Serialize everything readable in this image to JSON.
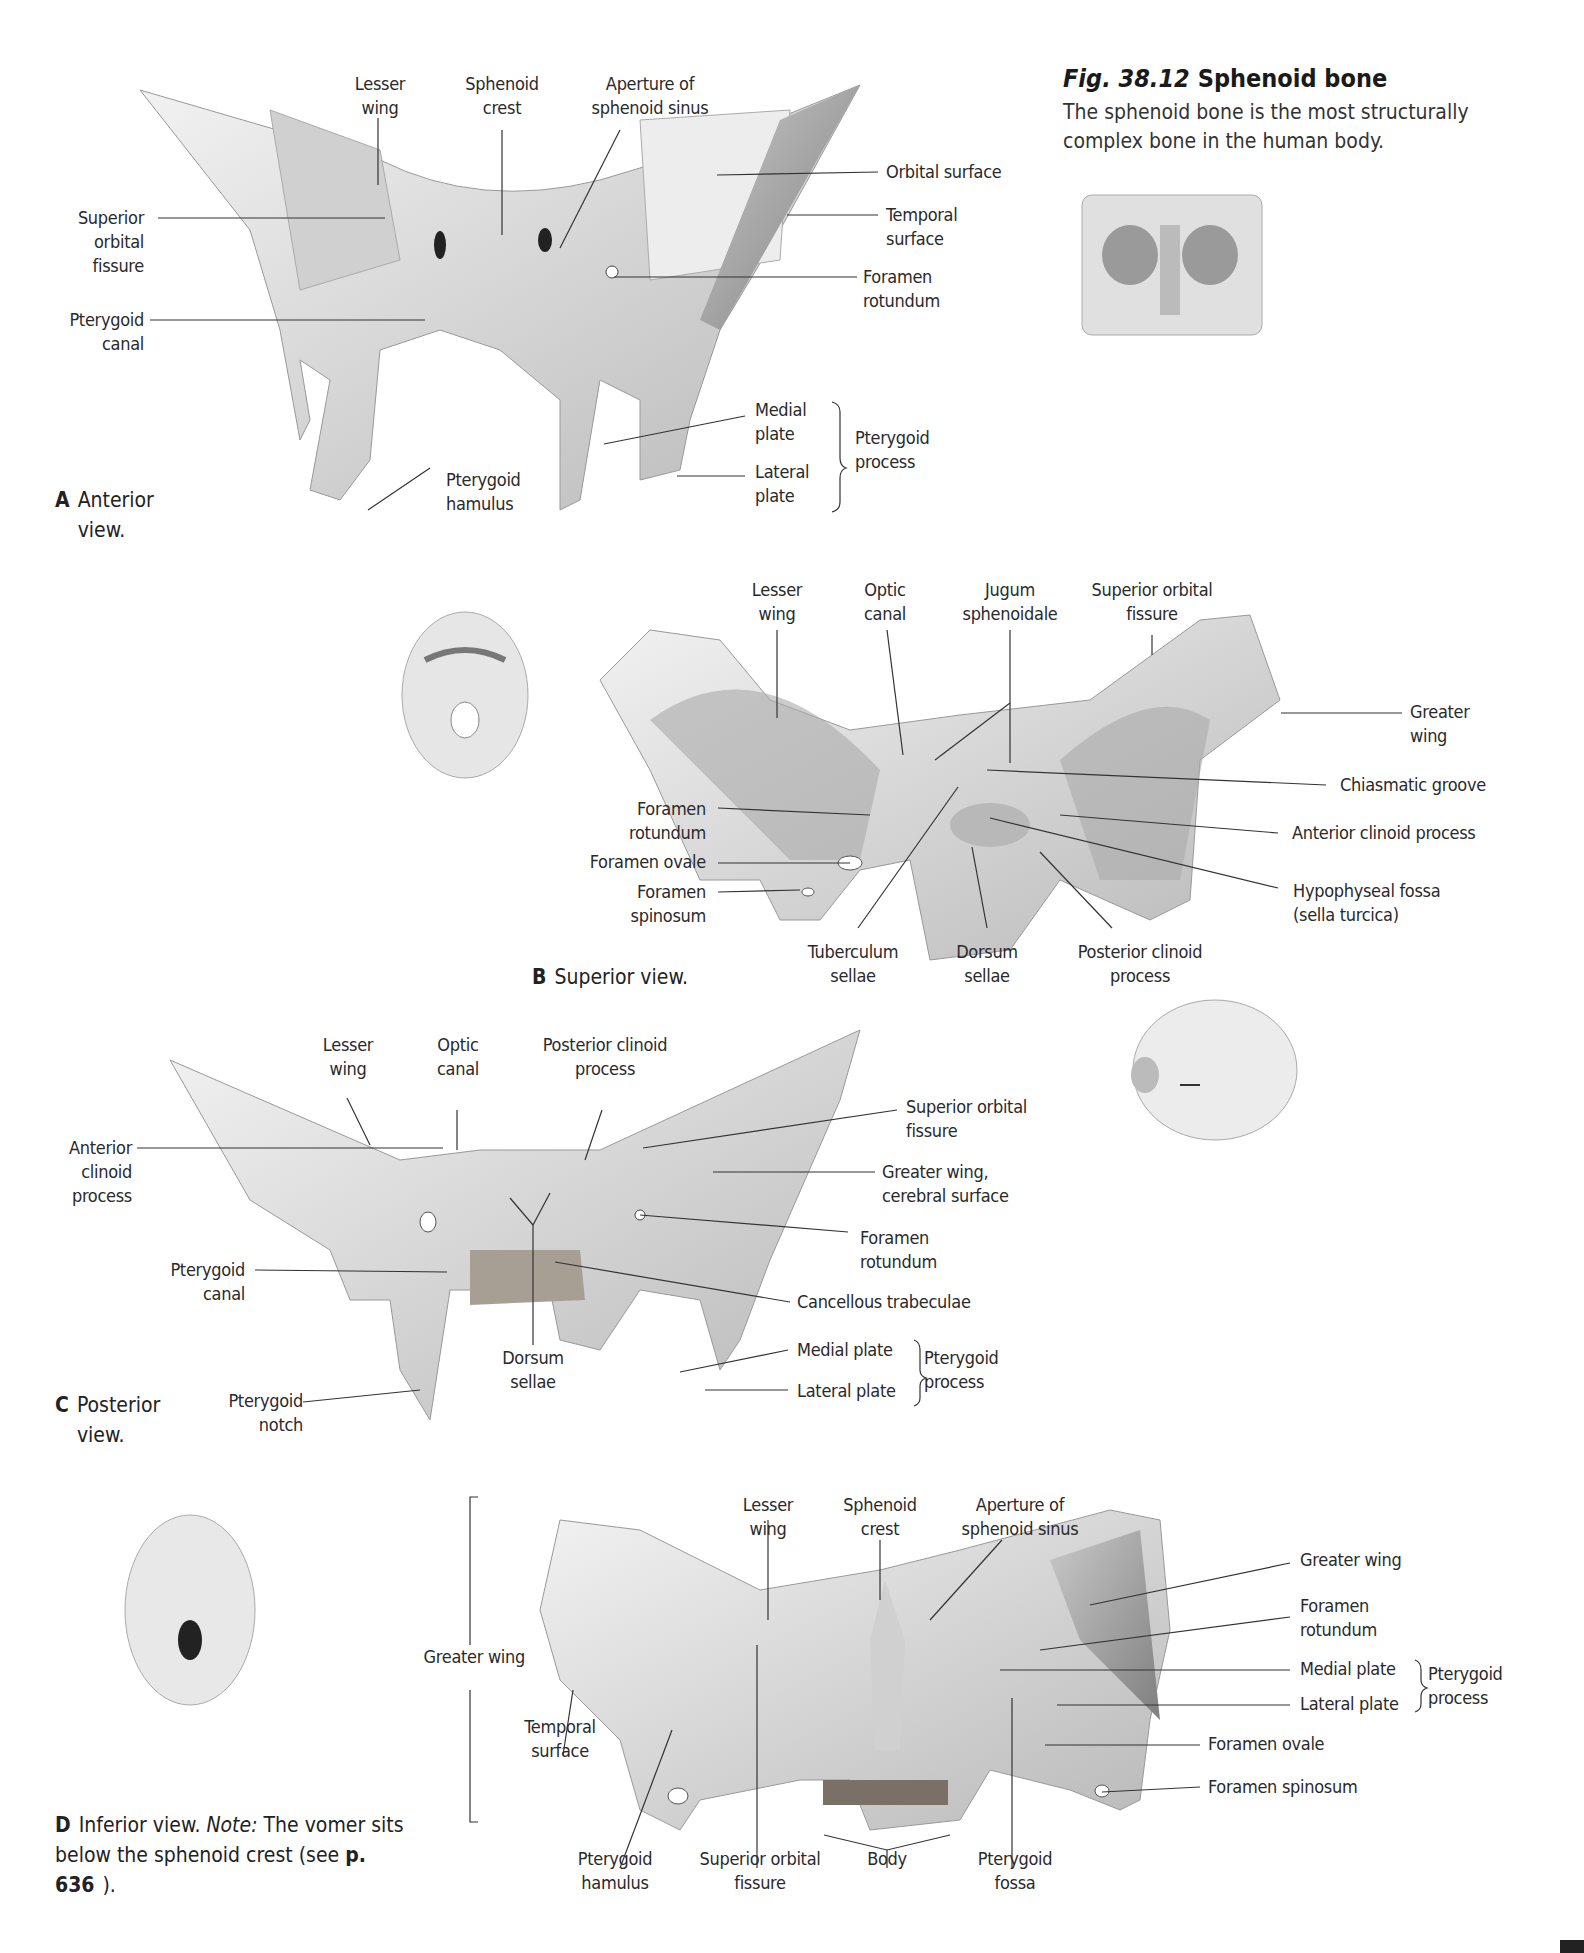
{
  "figure": {
    "number": "Fig. 38.12",
    "title": "Sphenoid bone",
    "description": "The sphenoid bone is the most structurally complex bone in the human body."
  },
  "panels": {
    "A": {
      "letter": "A",
      "caption": "Anterior\nview.",
      "labels": {
        "lesser_wing": "Lesser\nwing",
        "sphenoid_crest": "Sphenoid\ncrest",
        "aperture": "Aperture of\nsphenoid sinus",
        "orbital_surface": "Orbital surface",
        "temporal_surface": "Temporal\nsurface",
        "foramen_rotundum": "Foramen\nrotundum",
        "superior_orbital_fissure": "Superior\norbital\nfissure",
        "pterygoid_canal": "Pterygoid\ncanal",
        "medial_plate": "Medial\nplate",
        "lateral_plate": "Lateral\nplate",
        "pterygoid_process": "Pterygoid\nprocess",
        "pterygoid_hamulus": "Pterygoid\nhamulus"
      }
    },
    "B": {
      "letter": "B",
      "caption": "Superior view.",
      "labels": {
        "lesser_wing": "Lesser\nwing",
        "optic_canal": "Optic\ncanal",
        "jugum": "Jugum\nsphenoidale",
        "superior_orbital_fissure": "Superior orbital\nfissure",
        "greater_wing": "Greater\nwing",
        "chiasmatic_groove": "Chiasmatic groove",
        "anterior_clinoid": "Anterior clinoid process",
        "hypophyseal_fossa": "Hypophyseal fossa\n(sella turcica)",
        "foramen_rotundum": "Foramen\nrotundum",
        "foramen_ovale": "Foramen ovale",
        "foramen_spinosum": "Foramen\nspinosum",
        "tuberculum_sellae": "Tuberculum\nsellae",
        "dorsum_sellae": "Dorsum\nsellae",
        "posterior_clinoid": "Posterior clinoid\nprocess"
      }
    },
    "C": {
      "letter": "C",
      "caption": "Posterior\nview.",
      "labels": {
        "lesser_wing": "Lesser\nwing",
        "optic_canal": "Optic\ncanal",
        "posterior_clinoid": "Posterior clinoid\nprocess",
        "superior_orbital_fissure": "Superior orbital\nfissure",
        "greater_wing_cerebral": "Greater wing,\ncerebral surface",
        "foramen_rotundum": "Foramen\nrotundum",
        "cancellous": "Cancellous trabeculae",
        "medial_plate": "Medial plate",
        "lateral_plate": "Lateral plate",
        "pterygoid_process": "Pterygoid\nprocess",
        "anterior_clinoid": "Anterior\nclinoid\nprocess",
        "pterygoid_canal": "Pterygoid\ncanal",
        "dorsum_sellae": "Dorsum\nsellae",
        "pterygoid_notch": "Pterygoid\nnotch"
      }
    },
    "D": {
      "letter": "D",
      "caption_prefix": "Inferior view. ",
      "caption_note": "Note:",
      "caption_text": " The vomer sits below the sphenoid crest (see ",
      "caption_ref": "p. 636",
      "caption_suffix": ").",
      "labels": {
        "lesser_wing": "Lesser\nwing",
        "sphenoid_crest": "Sphenoid\ncrest",
        "aperture": "Aperture of\nsphenoid sinus",
        "greater_wing_right": "Greater wing",
        "foramen_rotundum": "Foramen\nrotundum",
        "medial_plate": "Medial plate",
        "lateral_plate": "Lateral plate",
        "pterygoid_process": "Pterygoid\nprocess",
        "foramen_ovale": "Foramen ovale",
        "foramen_spinosum": "Foramen spinosum",
        "greater_wing_left": "Greater wing",
        "temporal_surface": "Temporal\nsurface",
        "pterygoid_hamulus": "Pterygoid\nhamulus",
        "superior_orbital_fissure": "Superior orbital\nfissure",
        "body": "Body",
        "pterygoid_fossa": "Pterygoid\nfossa"
      }
    }
  },
  "colors": {
    "bone_light": "#e9e9e9",
    "bone_mid": "#c8c8c8",
    "bone_dark": "#8f8f8f",
    "leader": "#333333"
  }
}
